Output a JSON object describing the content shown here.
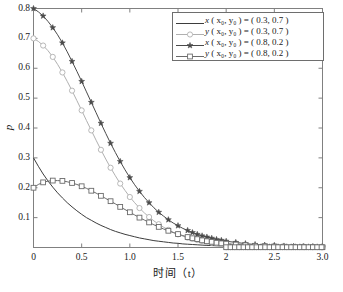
{
  "figure": {
    "axis_titles": {
      "x": "时间（t）",
      "y": "p"
    },
    "background": "#ffffff",
    "frame_color": "#808080"
  },
  "axes": {
    "x_ticks": [
      "0",
      "0.5",
      "1.0",
      "1.5",
      "2",
      "2.5",
      "3.0"
    ],
    "y_ticks": [
      "0.1",
      "0.2",
      "0.3",
      "0.4",
      "0.5",
      "0.6",
      "0.7",
      "0.8"
    ]
  },
  "legend": {
    "position": "top-right",
    "entries": [
      {
        "marker": "none",
        "var": "x",
        "args": "( x₀, y₀ ) = ( 0.3,  0.7 )",
        "x0": 0.3,
        "y0": 0.7,
        "color": "#3d3d3d"
      },
      {
        "marker": "circle",
        "var": "y",
        "args": "( x₀, y₀ ) = ( 0.3,  0.7 )",
        "x0": 0.3,
        "y0": 0.7,
        "color": "#b0b0b0"
      },
      {
        "marker": "star",
        "var": "x",
        "args": "( x₀, y₀ ) = ( 0.8,  0.2 )",
        "x0": 0.8,
        "y0": 0.2,
        "color": "#4a4a4a"
      },
      {
        "marker": "square",
        "var": "y",
        "args": "( x₀, y₀ ) = ( 0.8,  0.2 )",
        "x0": 0.8,
        "y0": 0.2,
        "color": "#6b6b6b"
      }
    ]
  },
  "chart_data": {
    "type": "line",
    "title": "",
    "xlabel": "时间（t）",
    "ylabel": "p",
    "xlim": [
      0,
      3.0
    ],
    "ylim": [
      0,
      0.8
    ],
    "grid": false,
    "legend_position": "top-right",
    "x": [
      0,
      0.05,
      0.1,
      0.15,
      0.2,
      0.25,
      0.3,
      0.35,
      0.4,
      0.45,
      0.5,
      0.55,
      0.6,
      0.65,
      0.7,
      0.75,
      0.8,
      0.85,
      0.9,
      0.95,
      1.0,
      1.05,
      1.1,
      1.15,
      1.2,
      1.25,
      1.3,
      1.35,
      1.4,
      1.45,
      1.5,
      1.55,
      1.6,
      1.65,
      1.7,
      1.75,
      1.8,
      1.85,
      1.9,
      1.95,
      2.0,
      2.1,
      2.2,
      2.3,
      2.4,
      2.5,
      2.6,
      2.7,
      2.8,
      2.9,
      3.0
    ],
    "series": [
      {
        "name": "x (x0, y0) = (0.3, 0.7)",
        "marker": "none",
        "color": "#3d3d3d",
        "values": [
          0.3,
          0.272,
          0.246,
          0.223,
          0.202,
          0.183,
          0.166,
          0.15,
          0.136,
          0.123,
          0.111,
          0.1,
          0.091,
          0.082,
          0.074,
          0.067,
          0.06,
          0.054,
          0.049,
          0.044,
          0.04,
          0.036,
          0.032,
          0.029,
          0.026,
          0.023,
          0.021,
          0.019,
          0.017,
          0.015,
          0.014,
          0.012,
          0.011,
          0.01,
          0.009,
          0.008,
          0.007,
          0.0065,
          0.0058,
          0.0052,
          0.0047,
          0.0038,
          0.0031,
          0.0025,
          0.002,
          0.0016,
          0.0013,
          0.0011,
          0.0009,
          0.0007,
          0.0006
        ]
      },
      {
        "name": "y (x0, y0) = (0.3, 0.7)",
        "marker": "circle",
        "color": "#b0b0b0",
        "values": [
          0.7,
          0.69,
          0.676,
          0.659,
          0.638,
          0.613,
          0.586,
          0.556,
          0.525,
          0.492,
          0.459,
          0.425,
          0.392,
          0.359,
          0.327,
          0.296,
          0.267,
          0.24,
          0.214,
          0.191,
          0.169,
          0.15,
          0.132,
          0.116,
          0.102,
          0.089,
          0.078,
          0.068,
          0.059,
          0.051,
          0.044,
          0.038,
          0.033,
          0.029,
          0.025,
          0.022,
          0.019,
          0.016,
          0.014,
          0.012,
          0.011,
          0.008,
          0.006,
          0.005,
          0.004,
          0.003,
          0.0024,
          0.0019,
          0.0015,
          0.0012,
          0.001
        ]
      },
      {
        "name": "x (x0, y0) = (0.8, 0.2)",
        "marker": "star",
        "color": "#4a4a4a",
        "values": [
          0.8,
          0.789,
          0.775,
          0.757,
          0.736,
          0.712,
          0.685,
          0.655,
          0.623,
          0.59,
          0.556,
          0.521,
          0.486,
          0.451,
          0.416,
          0.382,
          0.349,
          0.318,
          0.288,
          0.26,
          0.234,
          0.21,
          0.188,
          0.168,
          0.15,
          0.133,
          0.118,
          0.105,
          0.093,
          0.082,
          0.073,
          0.064,
          0.057,
          0.05,
          0.044,
          0.039,
          0.035,
          0.031,
          0.027,
          0.024,
          0.021,
          0.017,
          0.013,
          0.01,
          0.008,
          0.007,
          0.005,
          0.004,
          0.0035,
          0.0028,
          0.0022
        ]
      },
      {
        "name": "y (x0, y0) = (0.8, 0.2)",
        "marker": "square",
        "color": "#6b6b6b",
        "values": [
          0.2,
          0.211,
          0.218,
          0.222,
          0.224,
          0.224,
          0.223,
          0.22,
          0.216,
          0.211,
          0.205,
          0.198,
          0.19,
          0.182,
          0.173,
          0.164,
          0.155,
          0.146,
          0.136,
          0.127,
          0.118,
          0.109,
          0.1,
          0.092,
          0.084,
          0.076,
          0.069,
          0.062,
          0.056,
          0.05,
          0.045,
          0.04,
          0.035,
          0.031,
          0.028,
          0.024,
          0.021,
          0.019,
          0.016,
          0.014,
          0.013,
          0.01,
          0.0075,
          0.0057,
          0.0044,
          0.0034,
          0.0026,
          0.002,
          0.0016,
          0.0012,
          0.001
        ]
      }
    ]
  }
}
